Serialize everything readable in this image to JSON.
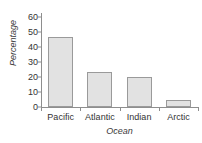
{
  "chart_data": {
    "type": "bar",
    "title": "",
    "subtitle": "",
    "xlabel": "Ocean",
    "ylabel": "Percentage",
    "categories": [
      "Pacific",
      "Atlantic",
      "Indian",
      "Arctic"
    ],
    "values": [
      47,
      23.5,
      20,
      5
    ],
    "ylim": [
      0,
      65
    ],
    "yticks": [
      0,
      10,
      20,
      30,
      40,
      50,
      60
    ],
    "ytick_labels": [
      "0",
      "10",
      "20",
      "30",
      "40",
      "50",
      "60"
    ],
    "grid": false,
    "legend": null,
    "legend_position": "none",
    "series": [
      {
        "name": "Percentage",
        "values": [
          47,
          23.5,
          20,
          5
        ]
      }
    ],
    "colors": {
      "bar_fill": "#e2e2e2",
      "bar_border": "#9a9a9a",
      "axis": "#8e8e8e",
      "text": "#333333",
      "background": "#ffffff"
    }
  }
}
